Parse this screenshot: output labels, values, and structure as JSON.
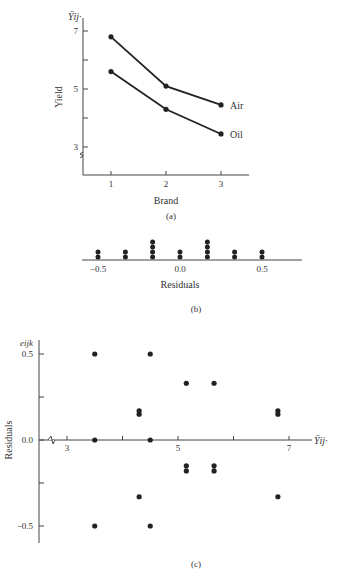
{
  "chart_data": [
    {
      "id": "a",
      "type": "line",
      "caption": "(a)",
      "title": "",
      "xlabel": "Brand",
      "ylabel": "Yield",
      "ylabel_top": "Ȳij·",
      "categories": [
        "1",
        "2",
        "3"
      ],
      "x": [
        1,
        2,
        3
      ],
      "yticks": [
        "3",
        "5",
        "7"
      ],
      "ylim": [
        2.5,
        7.3
      ],
      "axis_break_y": true,
      "grid": false,
      "legend_position": "inline-right",
      "series": [
        {
          "name": "Air",
          "values": [
            6.8,
            5.1,
            4.45
          ]
        },
        {
          "name": "Oil",
          "values": [
            5.6,
            4.3,
            3.45
          ]
        }
      ]
    },
    {
      "id": "b",
      "type": "scatter",
      "subtype": "dot-plot",
      "caption": "(b)",
      "xlabel": "Residuals",
      "xticks": [
        "-0.5",
        "0.0",
        "0.5"
      ],
      "xlim": [
        -0.6,
        0.65
      ],
      "grid": false,
      "x": [
        -0.5,
        -0.333,
        -0.167,
        0.0,
        0.167,
        0.333,
        0.5
      ],
      "counts": [
        2,
        2,
        4,
        2,
        4,
        2,
        2
      ]
    },
    {
      "id": "c",
      "type": "scatter",
      "caption": "(c)",
      "xlabel": "Ȳij·",
      "ylabel": "Residuals",
      "ylabel_top": "eijk",
      "xticks": [
        "3",
        "5",
        "7"
      ],
      "yticks": [
        "-0.5",
        "0.0",
        "0.5"
      ],
      "xlim": [
        2.5,
        7.5
      ],
      "ylim": [
        -0.6,
        0.55
      ],
      "axis_break_x": true,
      "grid": false,
      "points": [
        {
          "x": 3.5,
          "y": 0.5
        },
        {
          "x": 3.5,
          "y": 0.0
        },
        {
          "x": 3.5,
          "y": -0.5
        },
        {
          "x": 4.3,
          "y": 0.17
        },
        {
          "x": 4.3,
          "y": 0.15
        },
        {
          "x": 4.3,
          "y": -0.33
        },
        {
          "x": 4.5,
          "y": 0.5
        },
        {
          "x": 4.5,
          "y": 0.0
        },
        {
          "x": 4.5,
          "y": -0.5
        },
        {
          "x": 5.15,
          "y": 0.33
        },
        {
          "x": 5.15,
          "y": -0.15
        },
        {
          "x": 5.15,
          "y": -0.18
        },
        {
          "x": 5.65,
          "y": 0.33
        },
        {
          "x": 5.65,
          "y": -0.15
        },
        {
          "x": 5.65,
          "y": -0.18
        },
        {
          "x": 6.8,
          "y": 0.17
        },
        {
          "x": 6.8,
          "y": 0.15
        },
        {
          "x": 6.8,
          "y": -0.33
        }
      ]
    }
  ],
  "labels": {
    "a_caption": "(a)",
    "a_xlabel": "Brand",
    "a_ylabel": "Yield",
    "a_ytop": "Ȳij·",
    "a_air": "Air",
    "a_oil": "Oil",
    "b_caption": "(b)",
    "b_xlabel": "Residuals",
    "c_caption": "(c)",
    "c_ylabel": "Residuals",
    "c_ytop": "eijk",
    "c_xright": "Ȳij·"
  }
}
